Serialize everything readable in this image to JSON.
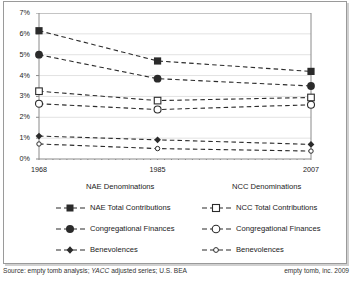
{
  "chart_data": {
    "type": "line",
    "title": "",
    "subtitle": "",
    "xlabel": "",
    "ylabel": "",
    "x": [
      1968,
      1985,
      2007
    ],
    "xtick_labels": [
      "1968",
      "1985",
      "2007"
    ],
    "xlim": [
      1968,
      2007
    ],
    "ylim": [
      0,
      7
    ],
    "ytick_labels": [
      "0%",
      "1%",
      "2%",
      "3%",
      "4%",
      "5%",
      "6%",
      "7%"
    ],
    "ytick_values": [
      0,
      1,
      2,
      3,
      4,
      5,
      6,
      7
    ],
    "grid": "horizontal",
    "minor_xticks": "yearly",
    "legend_position": "below",
    "series": [
      {
        "name": "NAE Total Contributions",
        "group": "NAE Denominations",
        "marker": "filled-square",
        "values": [
          6.15,
          4.7,
          4.2
        ]
      },
      {
        "name": "Congregational Finances",
        "group": "NAE Denominations",
        "marker": "filled-circle",
        "values": [
          5.0,
          3.85,
          3.5
        ]
      },
      {
        "name": "Benevolences",
        "group": "NAE Denominations",
        "marker": "filled-diamond",
        "values": [
          1.1,
          0.92,
          0.7
        ]
      },
      {
        "name": "NCC Total Contributions",
        "group": "NCC Denominations",
        "marker": "open-square",
        "values": [
          3.25,
          2.8,
          2.95
        ]
      },
      {
        "name": "Congregational Finances",
        "group": "NCC Denominations",
        "marker": "open-circle",
        "values": [
          2.65,
          2.37,
          2.6
        ]
      },
      {
        "name": "Benevolences",
        "group": "NCC Denominations",
        "marker": "open-small-circle",
        "values": [
          0.72,
          0.5,
          0.38
        ]
      }
    ]
  },
  "legend": {
    "nae": {
      "title": "NAE Denominations",
      "items": [
        {
          "label": "NAE Total Contributions",
          "marker": "filled-square"
        },
        {
          "label": "Congregational Finances",
          "marker": "filled-circle"
        },
        {
          "label": "Benevolences",
          "marker": "filled-diamond"
        }
      ]
    },
    "ncc": {
      "title": "NCC Denominations",
      "items": [
        {
          "label": "NCC Total Contributions",
          "marker": "open-square"
        },
        {
          "label": "Congregational Finances",
          "marker": "open-circle"
        },
        {
          "label": "Benevolences",
          "marker": "open-small-circle"
        }
      ]
    }
  },
  "footer": {
    "source_prefix": "Source: empty tomb analysis; ",
    "source_italic": "YACC",
    "source_suffix": " adjusted series; U.S. BEA",
    "credit": "empty tomb, inc. 2009"
  },
  "colors": {
    "axis": "#8a8a8a",
    "grid": "#e2e2e2",
    "series": "#2b2b2b",
    "frame": "#9a9a9a",
    "text": "#1a1a1a"
  }
}
